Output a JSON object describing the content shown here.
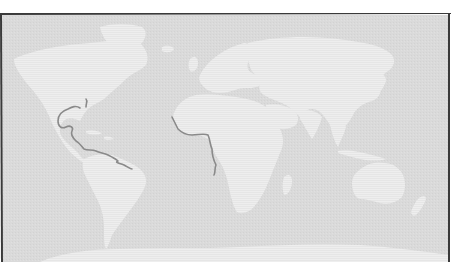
{
  "map": {
    "kind": "world-map",
    "projection": "equirectangular-like",
    "style": "grayscale scanned print",
    "colors": {
      "page_background": "#ffffff",
      "ocean": "#dcdcdc",
      "land": "#ececec",
      "frame": "#3a3a3a",
      "highlighted_coastline": "#8a8a8a"
    },
    "regions": [
      {
        "name": "North America"
      },
      {
        "name": "Greenland"
      },
      {
        "name": "South America"
      },
      {
        "name": "Europe"
      },
      {
        "name": "Africa"
      },
      {
        "name": "Madagascar"
      },
      {
        "name": "Asia"
      },
      {
        "name": "Arabian Peninsula"
      },
      {
        "name": "Indian Subcontinent"
      },
      {
        "name": "Southeast Asia"
      },
      {
        "name": "Japan"
      },
      {
        "name": "Indonesia"
      },
      {
        "name": "Australia"
      },
      {
        "name": "New Zealand"
      },
      {
        "name": "Antarctica"
      },
      {
        "name": "British Isles"
      },
      {
        "name": "Iceland"
      }
    ],
    "highlighted_coastlines": [
      {
        "name": "Gulf of Mexico and Caribbean coast"
      },
      {
        "name": "Gulf of Guinea coast (West Africa)"
      }
    ],
    "labels": []
  }
}
